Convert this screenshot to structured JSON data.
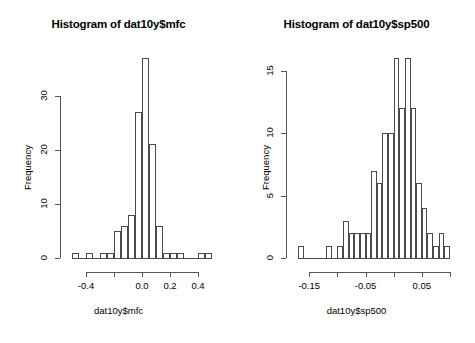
{
  "figure": {
    "kind": "r-base-graphics-histogram-pair",
    "width": 475,
    "height": 343,
    "background": "#ffffff",
    "ink_color": "#4a4a4a"
  },
  "panels": [
    {
      "id": "left",
      "title": "Histogram of dat10y$mfc",
      "xlabel": "dat10y$mfc",
      "ylabel": "Frequency",
      "x_ticks": [
        -0.4,
        -0.2,
        0.0,
        0.2,
        0.4
      ],
      "x_tick_labels": [
        "-0.4",
        "",
        "0.0",
        "0.2",
        "0.4"
      ],
      "y_ticks": [
        0,
        10,
        20,
        30
      ],
      "y_tick_labels": [
        "0",
        "10",
        "20",
        "30"
      ]
    },
    {
      "id": "right",
      "title": "Histogram of dat10y$sp500",
      "xlabel": "dat10y$sp500",
      "ylabel": "Frequency",
      "x_ticks": [
        -0.15,
        -0.1,
        -0.05,
        0.0,
        0.05,
        0.1
      ],
      "x_tick_labels": [
        "-0.15",
        "",
        "-0.05",
        "",
        "0.05",
        ""
      ],
      "y_ticks": [
        0,
        5,
        10,
        15
      ],
      "y_tick_labels": [
        "0",
        "5",
        "10",
        "15"
      ]
    }
  ],
  "chart_data": [
    {
      "type": "bar",
      "subtype": "histogram",
      "panel": "left",
      "title": "Histogram of dat10y$mfc",
      "xlabel": "dat10y$mfc",
      "ylabel": "Frequency",
      "binwidth": 0.05,
      "xlim": [
        -0.5,
        0.5
      ],
      "ylim": [
        0,
        37
      ],
      "grid": false,
      "legend": null,
      "bin_edges": [
        -0.5,
        -0.45,
        -0.4,
        -0.35,
        -0.3,
        -0.25,
        -0.2,
        -0.15,
        -0.1,
        -0.05,
        0.0,
        0.05,
        0.1,
        0.15,
        0.2,
        0.25,
        0.3,
        0.35,
        0.4,
        0.45,
        0.5
      ],
      "bin_centers": [
        -0.475,
        -0.425,
        -0.375,
        -0.325,
        -0.275,
        -0.225,
        -0.175,
        -0.125,
        -0.075,
        -0.025,
        0.025,
        0.075,
        0.125,
        0.175,
        0.225,
        0.275,
        0.325,
        0.375,
        0.425,
        0.475
      ],
      "values": [
        1,
        0,
        1,
        0,
        1,
        1,
        5,
        6,
        8,
        27,
        37,
        21,
        6,
        1,
        1,
        1,
        0,
        0,
        1,
        1
      ],
      "categories": [
        "-0.475",
        "-0.425",
        "-0.375",
        "-0.325",
        "-0.275",
        "-0.225",
        "-0.175",
        "-0.125",
        "-0.075",
        "-0.025",
        "0.025",
        "0.075",
        "0.125",
        "0.175",
        "0.225",
        "0.275",
        "0.325",
        "0.375",
        "0.425",
        "0.475"
      ]
    },
    {
      "type": "bar",
      "subtype": "histogram",
      "panel": "right",
      "title": "Histogram of dat10y$sp500",
      "xlabel": "dat10y$sp500",
      "ylabel": "Frequency",
      "binwidth": 0.01,
      "xlim": [
        -0.17,
        0.1
      ],
      "ylim": [
        0,
        16
      ],
      "grid": false,
      "legend": null,
      "bin_edges": [
        -0.17,
        -0.16,
        -0.15,
        -0.14,
        -0.13,
        -0.12,
        -0.11,
        -0.1,
        -0.09,
        -0.08,
        -0.07,
        -0.06,
        -0.05,
        -0.04,
        -0.03,
        -0.02,
        -0.01,
        0.0,
        0.01,
        0.02,
        0.03,
        0.04,
        0.05,
        0.06,
        0.07,
        0.08,
        0.09,
        0.1
      ],
      "bin_centers": [
        -0.165,
        -0.155,
        -0.145,
        -0.135,
        -0.125,
        -0.115,
        -0.105,
        -0.095,
        -0.085,
        -0.075,
        -0.065,
        -0.055,
        -0.045,
        -0.035,
        -0.025,
        -0.015,
        -0.005,
        0.005,
        0.015,
        0.025,
        0.035,
        0.045,
        0.055,
        0.065,
        0.075,
        0.085,
        0.095
      ],
      "values": [
        1,
        0,
        0,
        0,
        0,
        1,
        0,
        1,
        3,
        2,
        2,
        2,
        2,
        7,
        6,
        10,
        10,
        16,
        12,
        16,
        12,
        6,
        4,
        2,
        1,
        2,
        1
      ],
      "categories": [
        "-0.165",
        "-0.155",
        "-0.145",
        "-0.135",
        "-0.125",
        "-0.115",
        "-0.105",
        "-0.095",
        "-0.085",
        "-0.075",
        "-0.065",
        "-0.055",
        "-0.045",
        "-0.035",
        "-0.025",
        "-0.015",
        "-0.005",
        "0.005",
        "0.015",
        "0.025",
        "0.035",
        "0.045",
        "0.055",
        "0.065",
        "0.075",
        "0.085",
        "0.095"
      ]
    }
  ]
}
